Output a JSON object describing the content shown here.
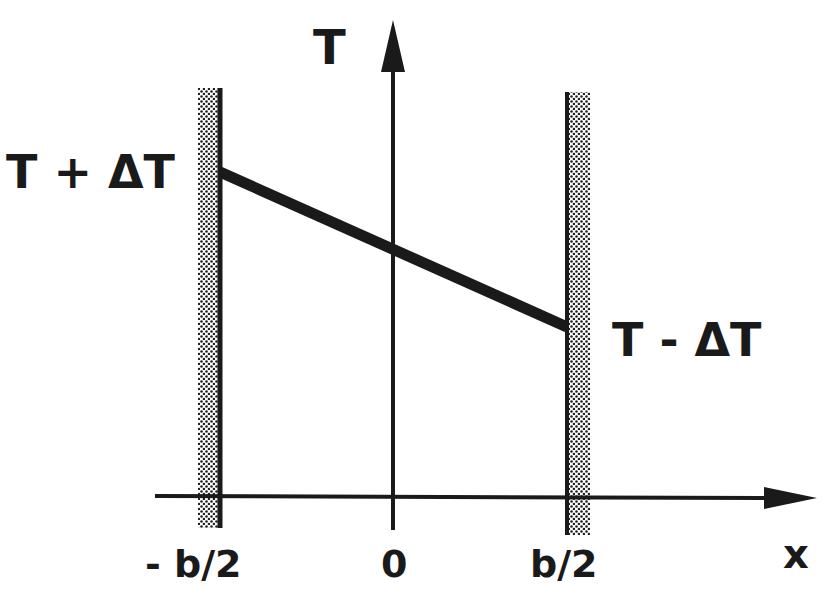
{
  "diagram": {
    "axes": {
      "y_label": "T",
      "x_label": "x"
    },
    "wall_labels": {
      "left_temperature": "T + ΔT",
      "right_temperature": "T - ΔT"
    },
    "tick_labels": {
      "left": "- b/2",
      "center": "0",
      "right": "b/2"
    },
    "colors": {
      "ink": "#1a1a1a",
      "background": "#ffffff"
    }
  }
}
